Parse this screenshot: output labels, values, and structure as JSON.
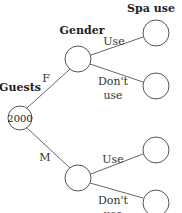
{
  "diagram": {
    "type": "tree",
    "headers": {
      "level0": "Guests",
      "level1": "Gender",
      "level2": "Spa use"
    },
    "root": {
      "value": "2000"
    },
    "branches": [
      {
        "label": "F",
        "children": [
          {
            "label_line1": "Use",
            "label_line2": ""
          },
          {
            "label_line1": "Don't",
            "label_line2": "use"
          }
        ]
      },
      {
        "label": "M",
        "children": [
          {
            "label_line1": "Use",
            "label_line2": ""
          },
          {
            "label_line1": "Don't",
            "label_line2": "use"
          }
        ]
      }
    ]
  }
}
